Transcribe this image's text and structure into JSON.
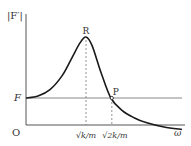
{
  "chart_data": {
    "type": "line",
    "title": "",
    "ylabel": "|F′|",
    "xlabel": "ω",
    "origin_label": "O",
    "reference_line": {
      "label": "F",
      "value": 1.0
    },
    "x_ticks": [
      {
        "label": "√k/m",
        "value": 1.0
      },
      {
        "label": "√2k/m",
        "value": 1.414
      }
    ],
    "points": [
      {
        "label": "R",
        "x": 1.0,
        "y": 2.24,
        "description": "resonance peak"
      },
      {
        "label": "P",
        "x": 1.414,
        "y": 1.0,
        "description": "curve crosses F level"
      }
    ],
    "series": [
      {
        "name": "|F′|(ω)",
        "x": [
          0,
          0.2,
          0.4,
          0.6,
          0.75,
          0.9,
          1.0,
          1.1,
          1.25,
          1.414,
          1.6,
          1.8,
          2.0,
          2.3,
          2.6
        ],
        "y": [
          1.0,
          1.04,
          1.17,
          1.45,
          1.78,
          2.12,
          2.24,
          2.07,
          1.52,
          1.0,
          0.75,
          0.6,
          0.5,
          0.41,
          0.36
        ]
      }
    ],
    "xlim": [
      0,
      2.65
    ],
    "ylim": [
      0,
      2.65
    ],
    "grid": false,
    "colors": {
      "curve": "#1a1a1a",
      "axis": "#555555",
      "reference": "#888888",
      "dashed": "#777777"
    }
  }
}
